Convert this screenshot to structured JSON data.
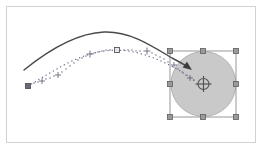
{
  "canvas": {
    "label": "vector-canvas",
    "background_color": "#ffffff",
    "border_color": "#d2d2d2",
    "width": 262,
    "height": 149,
    "frame": {
      "x": 6,
      "y": 6,
      "width": 250,
      "height": 137
    }
  },
  "shape": {
    "name": "circle-object",
    "type": "circle",
    "fill_color": "#c9c9c9",
    "stroke_color": "#a8a8a8",
    "center_x": 203.5,
    "center_y": 84,
    "radius": 32.5
  },
  "selection": {
    "name": "selection-bounding-box",
    "stroke_color": "#8c8c8c",
    "handle_fill": "#9a9a9a",
    "handle_stroke": "#5e5e5e",
    "handle_size": 5,
    "x": 170,
    "y": 51,
    "width": 66,
    "height": 66,
    "handles": [
      {
        "name": "handle-top-left",
        "x": 170,
        "y": 51
      },
      {
        "name": "handle-top-center",
        "x": 203,
        "y": 51
      },
      {
        "name": "handle-top-right",
        "x": 236,
        "y": 51
      },
      {
        "name": "handle-middle-left",
        "x": 170,
        "y": 84
      },
      {
        "name": "handle-middle-right",
        "x": 236,
        "y": 84
      },
      {
        "name": "handle-bottom-left",
        "x": 170,
        "y": 117
      },
      {
        "name": "handle-bottom-center",
        "x": 203,
        "y": 117
      },
      {
        "name": "handle-bottom-right",
        "x": 236,
        "y": 117
      }
    ]
  },
  "center_marker": {
    "name": "center-crosshair-marker",
    "x": 203.5,
    "y": 84,
    "radius": 5.5,
    "color": "#555555"
  },
  "motion_path": {
    "name": "motion-path-arrow",
    "stroke_color": "#4a4a4a",
    "stroke_width": 1.4,
    "arrowhead_color": "#3c3c3c",
    "path": "M 24,70 C 50,49 78,33 104,32 C 130,31 152,46 172,58 C 178,61 183,64 188,67",
    "arrow_tip": {
      "x": 192,
      "y": 70
    }
  },
  "trail_path": {
    "name": "dotted-trail-path",
    "stroke_color": "#6f6f8f",
    "stroke_width": 1.3,
    "dash_pattern": "0.2 4",
    "path": "M 28,86 C 52,72 76,55 104,51 C 132,47 158,58 182,72 C 188,76 192,79 196,82"
  },
  "trail_markers": [
    {
      "name": "trail-marker-square-start",
      "type": "square",
      "x": 28,
      "y": 86,
      "size": 5,
      "filled": true
    },
    {
      "name": "trail-marker-plus-1",
      "type": "plus",
      "x": 42,
      "y": 81,
      "size": 3
    },
    {
      "name": "trail-marker-plus-2",
      "type": "plus",
      "x": 58,
      "y": 75,
      "size": 3
    },
    {
      "name": "trail-marker-plus-3",
      "type": "plus",
      "x": 90,
      "y": 54,
      "size": 3.5
    },
    {
      "name": "trail-marker-square-apex",
      "type": "square",
      "x": 117,
      "y": 50,
      "size": 5,
      "filled": false
    },
    {
      "name": "trail-marker-plus-4",
      "type": "plus",
      "x": 147,
      "y": 51,
      "size": 3.5
    },
    {
      "name": "trail-marker-plus-5",
      "type": "plus",
      "x": 174,
      "y": 65,
      "size": 3
    },
    {
      "name": "trail-marker-plus-6",
      "type": "plus",
      "x": 190,
      "y": 78,
      "size": 3
    }
  ],
  "trail_dots": {
    "name": "trail-dot-sequence",
    "color": "#6f6f8f",
    "points": [
      {
        "x": 34,
        "y": 83
      },
      {
        "x": 38,
        "y": 82
      },
      {
        "x": 46,
        "y": 79
      },
      {
        "x": 50,
        "y": 78
      },
      {
        "x": 54,
        "y": 76
      },
      {
        "x": 62,
        "y": 72
      },
      {
        "x": 66,
        "y": 69
      },
      {
        "x": 70,
        "y": 66
      },
      {
        "x": 74,
        "y": 63
      },
      {
        "x": 78,
        "y": 60
      },
      {
        "x": 82,
        "y": 58
      },
      {
        "x": 86,
        "y": 56
      },
      {
        "x": 94,
        "y": 53
      },
      {
        "x": 98,
        "y": 52
      },
      {
        "x": 102,
        "y": 51
      },
      {
        "x": 106,
        "y": 50
      },
      {
        "x": 110,
        "y": 50
      },
      {
        "x": 124,
        "y": 50
      },
      {
        "x": 128,
        "y": 50
      },
      {
        "x": 132,
        "y": 50
      },
      {
        "x": 136,
        "y": 51
      },
      {
        "x": 140,
        "y": 51
      },
      {
        "x": 152,
        "y": 53
      },
      {
        "x": 156,
        "y": 55
      },
      {
        "x": 160,
        "y": 57
      },
      {
        "x": 164,
        "y": 59
      },
      {
        "x": 168,
        "y": 62
      },
      {
        "x": 178,
        "y": 69
      },
      {
        "x": 182,
        "y": 72
      },
      {
        "x": 186,
        "y": 75
      },
      {
        "x": 194,
        "y": 80
      }
    ]
  }
}
